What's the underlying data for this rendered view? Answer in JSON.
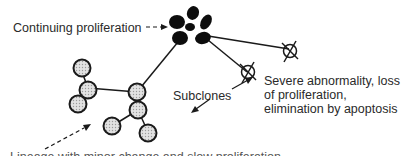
{
  "diagram": {
    "type": "clonal-evolution-tree",
    "labels": {
      "continuing_proliferation": "Continuing proliferation",
      "subclones": "Subclones",
      "severe_line1": "Severe abnormality, loss",
      "severe_line2": "of proliferation,",
      "severe_line3": "elimination by apoptosis",
      "bottom_clipped": "Lineage with minor change and slow proliferation"
    },
    "colors": {
      "line": "#1a1a1a",
      "stipple_cell": "#d6d6d6",
      "black_cell": "#0d0d0d",
      "text": "#2a2a2a"
    },
    "nodes": {
      "stippled_cells": 8,
      "black_cluster_cells": 6,
      "crossed_cells": 2
    }
  }
}
